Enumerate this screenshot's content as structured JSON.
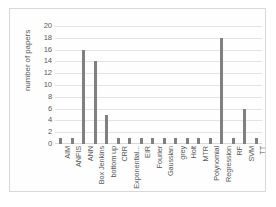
{
  "chart_data": {
    "type": "bar",
    "title": "",
    "subtitle": "",
    "xlabel": "",
    "ylabel": "number of papers",
    "ylim": [
      0,
      20
    ],
    "y_ticks": [
      0,
      2,
      4,
      6,
      8,
      10,
      12,
      14,
      16,
      18,
      20
    ],
    "grid": true,
    "legend": false,
    "legend_position": "none",
    "bar_color": "#808080",
    "categories": [
      "AIM",
      "ANFIS",
      "ANN",
      "Box Jenkins",
      "bottom up",
      "CRR",
      "Exponential...",
      "EIR",
      "Fourier",
      "Gaussian",
      "grey",
      "Holt",
      "MTR",
      "Polynomial",
      "Regression",
      "RF",
      "SVM",
      "TT"
    ],
    "values": [
      1,
      1,
      16,
      14,
      5,
      1,
      1,
      1,
      1,
      1,
      1,
      1,
      1,
      1,
      18,
      1,
      6,
      1
    ],
    "series": [
      {
        "name": "number of papers",
        "values": [
          1,
          1,
          16,
          14,
          5,
          1,
          1,
          1,
          1,
          1,
          1,
          1,
          1,
          1,
          18,
          1,
          6,
          1
        ]
      }
    ]
  },
  "figure": {
    "background_color": "#ffffff",
    "frame_color": "#d8d8d8",
    "grid_color": "#e3e3e3",
    "text_color": "#5a5a5a"
  }
}
